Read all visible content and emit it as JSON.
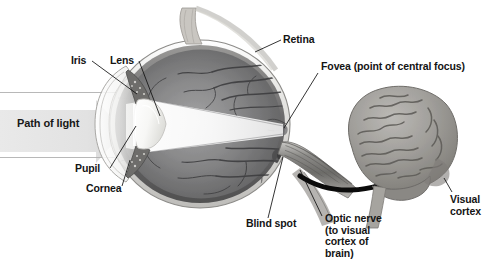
{
  "figure": {
    "width": 495,
    "height": 266,
    "background": "#ffffff"
  },
  "labels": {
    "iris": "Iris",
    "lens": "Lens",
    "retina": "Retina",
    "fovea": "Fovea (point of central focus)",
    "path_of_light": "Path of light",
    "pupil": "Pupil",
    "cornea": "Cornea",
    "blind_spot": "Blind spot",
    "optic_nerve": "Optic nerve\n(to visual\ncortex of\nbrain)",
    "visual_cortex": "Visual\ncortex"
  },
  "parts": [
    {
      "name": "iris",
      "label": "Iris"
    },
    {
      "name": "lens",
      "label": "Lens"
    },
    {
      "name": "retina",
      "label": "Retina"
    },
    {
      "name": "fovea",
      "label": "Fovea (point of central focus)"
    },
    {
      "name": "pupil",
      "label": "Pupil"
    },
    {
      "name": "cornea",
      "label": "Cornea"
    },
    {
      "name": "blind-spot",
      "label": "Blind spot"
    },
    {
      "name": "optic-nerve",
      "label": "Optic nerve (to visual cortex of brain)"
    },
    {
      "name": "visual-cortex",
      "label": "Visual cortex"
    }
  ],
  "colors": {
    "text": "#141414",
    "leader_line": "#1a1a1a",
    "path_arrow": "#e3e3e3",
    "path_arrow_edge": "#d2d2d2",
    "ray_line": "#a8a8a8",
    "sclera": "#f2f1ef",
    "vitreous_dark": "#6f6f70",
    "vitreous_light": "#9a9a9b",
    "choroid": "#5a5a5b",
    "vessel": "#3d3d3f",
    "lens_white": "#fbfbfa",
    "light_cone": "#ffffff",
    "optic_nerve": "#8d8d8c",
    "brain": "#9b9a97",
    "brain_shadow": "#6a6967",
    "black_arrow": "#0b0b0b"
  }
}
